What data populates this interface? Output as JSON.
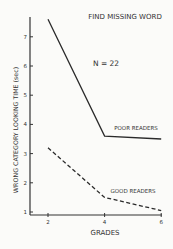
{
  "chart_data": {
    "type": "line",
    "title": "FIND MISSING WORD",
    "annotation": "N = 22",
    "xlabel": "GRADES",
    "ylabel": "WRONG CATEGORY LOOKING TIME (sec)",
    "x": [
      2,
      4,
      6
    ],
    "xticks": [
      "2",
      "4",
      "6"
    ],
    "yticks": [
      "1",
      "2",
      "3",
      "4",
      "5",
      "6",
      "7"
    ],
    "ylim": [
      1,
      7.7
    ],
    "xlim": [
      1.4,
      6
    ],
    "grid": false,
    "series": [
      {
        "name": "POOR READERS",
        "style": "solid",
        "values": [
          7.6,
          3.6,
          3.5
        ]
      },
      {
        "name": "GOOD READERS",
        "style": "dashed",
        "values": [
          3.2,
          1.5,
          1.05
        ]
      }
    ]
  }
}
